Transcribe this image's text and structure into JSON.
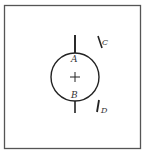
{
  "diagram": {
    "labels": {
      "a": "A",
      "b": "B",
      "c": "C",
      "d": "D",
      "center": "+"
    },
    "colors": {
      "stroke": "#222222",
      "frame": "#555555",
      "background": "#ffffff"
    }
  }
}
